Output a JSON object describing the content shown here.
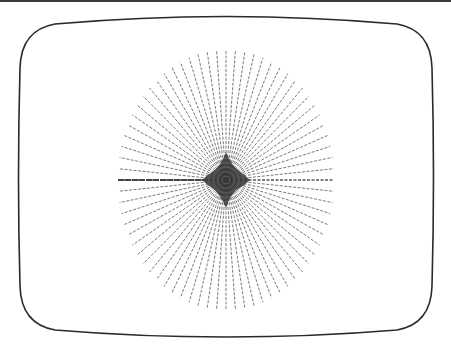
{
  "figure": {
    "title": "Starburst line-drawing on a CRT screen",
    "background_color": "#ffffff",
    "top_rule_color": "#3a3a3a"
  },
  "screen_frame": {
    "shape": "rounded CRT bezel outline",
    "stroke_color": "#2a2a2a",
    "stroke_width": 1.6,
    "left": 19,
    "right": 433,
    "top_middle": 16,
    "top_corner": 24,
    "bottom_middle": 337,
    "bottom_corner": 330
  },
  "starburst": {
    "center_x": 226,
    "center_y": 180,
    "radius_x": 108,
    "radius_y": 130,
    "ray_count": 72,
    "ray_color": "#555555",
    "core_color": "#2e2e2e",
    "dash_pattern": "3 1.5"
  }
}
